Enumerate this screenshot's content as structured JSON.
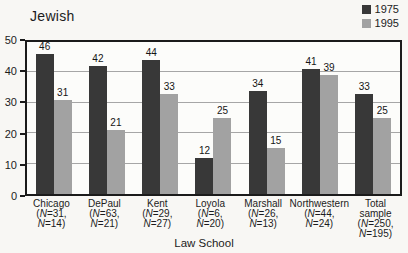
{
  "chart_data": {
    "type": "bar",
    "title": "Jewish",
    "xlabel": "Law School",
    "ylabel": "",
    "ylim": [
      0,
      50
    ],
    "yticks": [
      0,
      10,
      20,
      30,
      40,
      50
    ],
    "gridlines": [
      10,
      20,
      30,
      40
    ],
    "grid": "horizontal",
    "legend_position": "top-right",
    "frame_color": "#1b1b1b",
    "categories": [
      "Chicago",
      "DePaul",
      "Kent",
      "Loyola",
      "Marshall",
      "Northwestern",
      "Total sample"
    ],
    "series": [
      {
        "name": "1975",
        "color": "#383838",
        "values": [
          46,
          42,
          44,
          12,
          34,
          41,
          33
        ]
      },
      {
        "name": "1995",
        "color": "#a2a2a2",
        "values": [
          31,
          21,
          33,
          25,
          15,
          39,
          25
        ]
      }
    ],
    "tick_label_lines": [
      [
        "Chicago",
        "(N=31,",
        "N=14)"
      ],
      [
        "DePaul",
        "(N=63,",
        "N=21)"
      ],
      [
        "Kent",
        "(N=29,",
        "N=27)"
      ],
      [
        "Loyola",
        "(N=6,",
        "N=20)"
      ],
      [
        "Marshall",
        "(N=26,",
        "N=13)"
      ],
      [
        "Northwestern",
        "(N=44,",
        "N=24)"
      ],
      [
        "Total",
        "sample",
        "(N=250,",
        "N=195)"
      ]
    ]
  }
}
